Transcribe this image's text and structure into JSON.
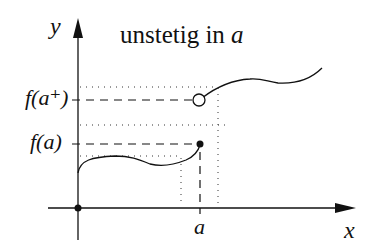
{
  "title": {
    "prefix": "unstetig in ",
    "var": "a"
  },
  "axes": {
    "x_label": "x",
    "y_label": "y"
  },
  "ticks": {
    "a_label": "a",
    "fa_label": "f(a)",
    "fa_plus_label": "f(a⁺)"
  },
  "colors": {
    "line": "#111111",
    "background": "#ffffff"
  }
}
